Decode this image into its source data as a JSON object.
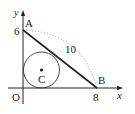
{
  "figure": {
    "type": "geometry",
    "axes": {
      "x_label": "x",
      "y_label": "y",
      "origin_label": "O"
    },
    "points": {
      "A": {
        "label": "A",
        "coord_label": "6"
      },
      "B": {
        "label": "B",
        "coord_label": "8"
      },
      "C": {
        "label": "C"
      }
    },
    "segment_AB_length_label": "10",
    "colors": {
      "line": "#222222",
      "dotted_arc": "#aaaaaa",
      "background": "#ffffff"
    }
  }
}
